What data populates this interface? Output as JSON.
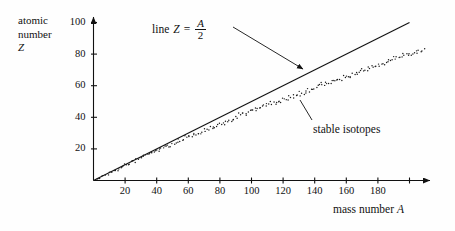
{
  "figure": {
    "background_color": "#fefefe",
    "ink_color": "#111111"
  },
  "axes": {
    "y_title_line1": "atomic",
    "y_title_line2": "number",
    "y_title_line3": "Z",
    "x_title_prefix": "mass number",
    "x_title_symbol": "A"
  },
  "annotations": {
    "line_label_prefix": "line",
    "line_label_symbol": "Z",
    "line_label_equals": "=",
    "line_label_numerator": "A",
    "line_label_denominator": "2",
    "isotopes_label": "stable isotopes"
  },
  "chart_data": {
    "type": "scatter",
    "title": "",
    "xlabel": "mass number A",
    "ylabel": "atomic number Z",
    "xlim": [
      0,
      212
    ],
    "ylim": [
      0,
      106
    ],
    "grid": false,
    "legend": "none",
    "x_ticks": [
      20,
      40,
      60,
      80,
      100,
      120,
      140,
      160,
      180,
      200
    ],
    "x_tick_labels": [
      "20",
      "40",
      "60",
      "80",
      "100",
      "120",
      "140",
      "160",
      "180",
      ""
    ],
    "y_ticks": [
      20,
      40,
      60,
      80,
      100
    ],
    "y_tick_labels": [
      "20",
      "40",
      "60",
      "80",
      "100"
    ],
    "series": [
      {
        "name": "line Z = A/2",
        "type": "line",
        "equation": "Z = A/2",
        "slope": 0.5,
        "intercept": 0,
        "x_start": 0,
        "x_end": 200,
        "y_start": 0,
        "y_end": 100
      },
      {
        "name": "stable isotopes",
        "type": "scatter",
        "marker": "dot",
        "points": [
          [
            2,
            1
          ],
          [
            3,
            2
          ],
          [
            4,
            2
          ],
          [
            6,
            3
          ],
          [
            7,
            3
          ],
          [
            9,
            4
          ],
          [
            10,
            5
          ],
          [
            11,
            5
          ],
          [
            12,
            6
          ],
          [
            13,
            6
          ],
          [
            14,
            7
          ],
          [
            15,
            7
          ],
          [
            16,
            8
          ],
          [
            17,
            8
          ],
          [
            18,
            8
          ],
          [
            19,
            9
          ],
          [
            20,
            10
          ],
          [
            21,
            10
          ],
          [
            22,
            10
          ],
          [
            23,
            11
          ],
          [
            24,
            12
          ],
          [
            25,
            12
          ],
          [
            26,
            12
          ],
          [
            27,
            13
          ],
          [
            28,
            14
          ],
          [
            29,
            14
          ],
          [
            30,
            14
          ],
          [
            31,
            15
          ],
          [
            32,
            16
          ],
          [
            33,
            16
          ],
          [
            34,
            16
          ],
          [
            35,
            17
          ],
          [
            36,
            18
          ],
          [
            37,
            17
          ],
          [
            38,
            18
          ],
          [
            39,
            19
          ],
          [
            40,
            20
          ],
          [
            41,
            19
          ],
          [
            42,
            20
          ],
          [
            43,
            20
          ],
          [
            44,
            20
          ],
          [
            45,
            21
          ],
          [
            46,
            22
          ],
          [
            47,
            22
          ],
          [
            48,
            22
          ],
          [
            49,
            22
          ],
          [
            50,
            24
          ],
          [
            51,
            23
          ],
          [
            52,
            24
          ],
          [
            53,
            24
          ],
          [
            54,
            26
          ],
          [
            55,
            25
          ],
          [
            56,
            26
          ],
          [
            57,
            26
          ],
          [
            58,
            28
          ],
          [
            59,
            27
          ],
          [
            60,
            28
          ],
          [
            61,
            28
          ],
          [
            62,
            28
          ],
          [
            63,
            29
          ],
          [
            64,
            30
          ],
          [
            65,
            29
          ],
          [
            66,
            30
          ],
          [
            67,
            30
          ],
          [
            68,
            30
          ],
          [
            69,
            31
          ],
          [
            70,
            32
          ],
          [
            71,
            31
          ],
          [
            72,
            32
          ],
          [
            73,
            32
          ],
          [
            74,
            34
          ],
          [
            75,
            33
          ],
          [
            76,
            34
          ],
          [
            77,
            34
          ],
          [
            78,
            34
          ],
          [
            79,
            35
          ],
          [
            80,
            36
          ],
          [
            81,
            35
          ],
          [
            82,
            36
          ],
          [
            83,
            36
          ],
          [
            84,
            38
          ],
          [
            85,
            37
          ],
          [
            86,
            38
          ],
          [
            87,
            38
          ],
          [
            88,
            38
          ],
          [
            89,
            39
          ],
          [
            90,
            40
          ],
          [
            91,
            40
          ],
          [
            92,
            42
          ],
          [
            93,
            41
          ],
          [
            94,
            42
          ],
          [
            95,
            42
          ],
          [
            96,
            42
          ],
          [
            97,
            42
          ],
          [
            98,
            44
          ],
          [
            99,
            44
          ],
          [
            100,
            44
          ],
          [
            101,
            44
          ],
          [
            102,
            46
          ],
          [
            103,
            45
          ],
          [
            104,
            46
          ],
          [
            105,
            46
          ],
          [
            106,
            46
          ],
          [
            107,
            47
          ],
          [
            108,
            48
          ],
          [
            109,
            47
          ],
          [
            110,
            48
          ],
          [
            111,
            48
          ],
          [
            112,
            50
          ],
          [
            113,
            48
          ],
          [
            114,
            50
          ],
          [
            115,
            49
          ],
          [
            116,
            50
          ],
          [
            117,
            50
          ],
          [
            118,
            50
          ],
          [
            119,
            50
          ],
          [
            120,
            52
          ],
          [
            121,
            51
          ],
          [
            122,
            52
          ],
          [
            123,
            51
          ],
          [
            124,
            54
          ],
          [
            125,
            52
          ],
          [
            126,
            54
          ],
          [
            127,
            53
          ],
          [
            128,
            54
          ],
          [
            129,
            54
          ],
          [
            130,
            56
          ],
          [
            131,
            54
          ],
          [
            132,
            56
          ],
          [
            133,
            55
          ],
          [
            134,
            56
          ],
          [
            135,
            56
          ],
          [
            136,
            58
          ],
          [
            137,
            56
          ],
          [
            138,
            57
          ],
          [
            139,
            57
          ],
          [
            140,
            58
          ],
          [
            141,
            59
          ],
          [
            142,
            60
          ],
          [
            143,
            60
          ],
          [
            144,
            62
          ],
          [
            145,
            60
          ],
          [
            146,
            60
          ],
          [
            147,
            62
          ],
          [
            148,
            62
          ],
          [
            149,
            62
          ],
          [
            150,
            62
          ],
          [
            151,
            63
          ],
          [
            152,
            64
          ],
          [
            153,
            63
          ],
          [
            154,
            64
          ],
          [
            155,
            64
          ],
          [
            156,
            64
          ],
          [
            157,
            64
          ],
          [
            158,
            66
          ],
          [
            159,
            65
          ],
          [
            160,
            66
          ],
          [
            161,
            66
          ],
          [
            162,
            66
          ],
          [
            163,
            66
          ],
          [
            164,
            68
          ],
          [
            165,
            67
          ],
          [
            166,
            68
          ],
          [
            167,
            68
          ],
          [
            168,
            68
          ],
          [
            169,
            69
          ],
          [
            170,
            70
          ],
          [
            171,
            70
          ],
          [
            172,
            70
          ],
          [
            173,
            70
          ],
          [
            174,
            72
          ],
          [
            175,
            71
          ],
          [
            176,
            72
          ],
          [
            177,
            72
          ],
          [
            178,
            72
          ],
          [
            179,
            72
          ],
          [
            180,
            74
          ],
          [
            181,
            73
          ],
          [
            182,
            74
          ],
          [
            183,
            74
          ],
          [
            184,
            74
          ],
          [
            185,
            75
          ],
          [
            186,
            76
          ],
          [
            187,
            76
          ],
          [
            188,
            76
          ],
          [
            189,
            76
          ],
          [
            190,
            78
          ],
          [
            191,
            77
          ],
          [
            192,
            78
          ],
          [
            193,
            77
          ],
          [
            194,
            78
          ],
          [
            195,
            78
          ],
          [
            196,
            80
          ],
          [
            197,
            79
          ],
          [
            198,
            80
          ],
          [
            199,
            80
          ],
          [
            200,
            80
          ],
          [
            201,
            80
          ],
          [
            202,
            80
          ],
          [
            203,
            81
          ],
          [
            204,
            82
          ],
          [
            205,
            81
          ],
          [
            206,
            82
          ],
          [
            207,
            82
          ],
          [
            208,
            82
          ],
          [
            209,
            83
          ]
        ]
      }
    ]
  }
}
